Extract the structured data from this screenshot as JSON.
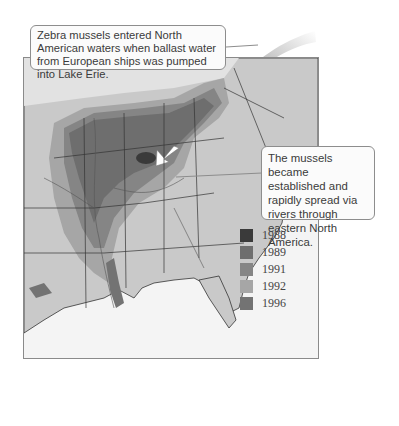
{
  "callouts": {
    "top": "Zebra mussels entered North American waters when ballast water from European ships was pumped into Lake Erie.",
    "right": "The mussels became established and rapidly spread via rivers through eastern North America."
  },
  "legend": {
    "items": [
      {
        "label": "1988",
        "color": "#3a3a3a"
      },
      {
        "label": "1989",
        "color": "#6e6e6e"
      },
      {
        "label": "1991",
        "color": "#858585"
      },
      {
        "label": "1992",
        "color": "#a6a6a6"
      },
      {
        "label": "1996",
        "color": "#737373"
      }
    ]
  },
  "colors": {
    "land": "#c9c9c9",
    "water": "#f4f4f4",
    "spread_1989": "#6e6e6e",
    "spread_1991": "#858585",
    "spread_1992": "#a6a6a6",
    "border": "#333333"
  }
}
